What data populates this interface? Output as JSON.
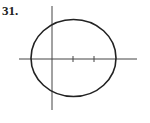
{
  "problem": {
    "number": "31."
  },
  "figure": {
    "type": "ellipse-on-axes",
    "stroke_color": "#222222",
    "axis_color": "#444444",
    "x_axis": {
      "y": 59,
      "x1": 19,
      "x2": 137
    },
    "y_axis": {
      "x": 52,
      "y1": 6,
      "y2": 110
    },
    "ellipse": {
      "cx": 73.5,
      "cy": 58,
      "rx": 42.5,
      "ry": 38.5
    },
    "ticks": [
      {
        "x": 73
      },
      {
        "x": 94
      }
    ]
  }
}
